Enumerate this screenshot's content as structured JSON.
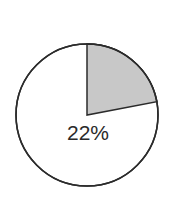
{
  "chart_data": {
    "type": "pie",
    "title": "",
    "categories": [
      "Highlighted",
      "Remainder"
    ],
    "values": [
      22,
      78
    ],
    "labels": [
      "22%",
      ""
    ],
    "colors": [
      "#c8c8c8",
      "#ffffff"
    ],
    "outline_color": "#2b2b2b",
    "start_angle_deg": 0,
    "direction": "clockwise",
    "legend": "none"
  },
  "label": "22%"
}
